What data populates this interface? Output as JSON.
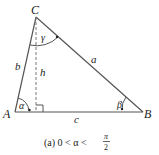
{
  "figure": {
    "vertices": {
      "A": {
        "label": "A",
        "x": 15,
        "y": 112
      },
      "B": {
        "label": "B",
        "x": 143,
        "y": 112
      },
      "C": {
        "label": "C",
        "x": 36,
        "y": 17
      }
    },
    "altitude_foot": {
      "x": 36,
      "y": 112
    },
    "sides": {
      "a": "a",
      "b": "b",
      "c": "c"
    },
    "altitude": "h",
    "angles": {
      "alpha": "α",
      "beta": "β",
      "gamma": "γ"
    },
    "caption": {
      "prefix": "(a)  0 < α <",
      "fraction_num": "π",
      "fraction_den": "2"
    },
    "colors": {
      "line": "#555555",
      "text": "#222222",
      "background": "#ffffff"
    }
  }
}
